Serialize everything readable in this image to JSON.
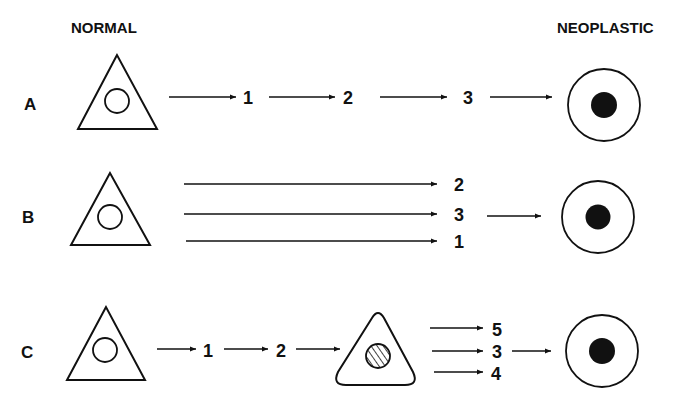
{
  "headers": {
    "left": "NORMAL",
    "right": "NEOPLASTIC"
  },
  "rows": [
    {
      "label": "A",
      "description": "Sequential progression",
      "steps": [
        "1",
        "2",
        "3"
      ]
    },
    {
      "label": "B",
      "description": "Parallel independent steps",
      "steps": [
        "2",
        "3",
        "1"
      ]
    },
    {
      "label": "C",
      "description": "Sequential then parallel via intermediate cell",
      "steps_before": [
        "1",
        "2"
      ],
      "steps_after": [
        "5",
        "3",
        "4"
      ]
    }
  ],
  "icons": {
    "normal_cell": "triangle-cell-open-nucleus",
    "intermediate_cell": "rounded-triangle-cell-hatched-nucleus",
    "neoplastic_cell": "round-cell-solid-nucleus",
    "arrow": "right-arrow"
  },
  "colors": {
    "ink": "#111111",
    "background": "#ffffff"
  }
}
